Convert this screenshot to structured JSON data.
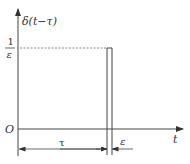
{
  "diagram": {
    "y_label": "δ(t−τ)",
    "x_label": "t",
    "origin_label": "O",
    "height_label": {
      "numerator": "1",
      "denominator": "ε"
    },
    "shift_label": "τ",
    "width_label": "ε",
    "colors": {
      "line": "#444444",
      "dashed": "#666666",
      "background": "#ffffff"
    }
  }
}
